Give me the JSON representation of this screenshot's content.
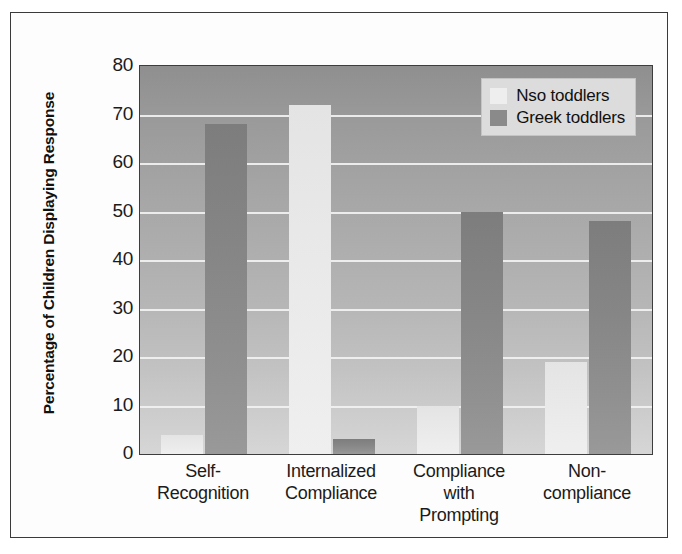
{
  "chart_data": {
    "type": "bar",
    "title": "",
    "subtitle": "",
    "xlabel": "",
    "ylabel": "Percentage of Children\nDisplaying Response",
    "ylim": [
      0,
      80
    ],
    "yticks": [
      80,
      70,
      60,
      50,
      40,
      30,
      20,
      10,
      0
    ],
    "grid": true,
    "legend_position": "top-right",
    "categories": [
      "Self-\nRecognition",
      "Internalized\nCompliance",
      "Compliance\nwith\nPrompting",
      "Non-\ncompliance"
    ],
    "series": [
      {
        "name": "Nso toddlers",
        "color": "#ececec",
        "values": [
          4,
          72,
          10,
          19
        ]
      },
      {
        "name": "Greek toddlers",
        "color": "#8a8a8a",
        "values": [
          68,
          3,
          50,
          48
        ]
      }
    ]
  },
  "colors": {
    "plot_background_top": "#8f8f8f",
    "plot_background_bottom": "#d6d6d6",
    "gridline": "#f2f2f2",
    "frame": "#3a3a3a",
    "legend_background": "#dcdcdc",
    "page_background": "#ffffff"
  }
}
